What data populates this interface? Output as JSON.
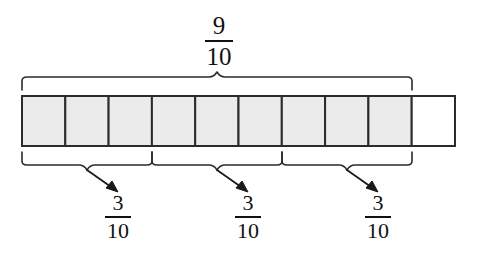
{
  "figure": {
    "kind": "fraction-bar-model",
    "background_color": "#ffffff",
    "ink_color": "#111111",
    "shaded_fill_color": "#ebebeb",
    "unshaded_fill_color": "#ffffff"
  },
  "bar": {
    "total_parts": 10,
    "shaded_parts": 9,
    "unshaded_parts": 1,
    "cells": [
      {
        "index": 1,
        "shaded": true
      },
      {
        "index": 2,
        "shaded": true
      },
      {
        "index": 3,
        "shaded": true
      },
      {
        "index": 4,
        "shaded": true
      },
      {
        "index": 5,
        "shaded": true
      },
      {
        "index": 6,
        "shaded": true
      },
      {
        "index": 7,
        "shaded": true
      },
      {
        "index": 8,
        "shaded": true
      },
      {
        "index": 9,
        "shaded": true
      },
      {
        "index": 10,
        "shaded": false
      }
    ],
    "geometry": {
      "x": 22,
      "y": 96,
      "width": 433,
      "height": 50,
      "cell_width": 43.3
    }
  },
  "top_brace": {
    "label": {
      "numerator": "9",
      "denominator": "10"
    },
    "covers_parts": 9,
    "span_start_x": 22,
    "span_end_x": 412,
    "y": 88,
    "peak_x": 217
  },
  "bottom_braces": [
    {
      "label": {
        "numerator": "3",
        "denominator": "10"
      },
      "covers_parts": 3,
      "span_start_x": 22,
      "span_end_x": 152,
      "y": 153,
      "notch_x": 87,
      "arrow_tip_x": 118,
      "arrow_tip_y": 192
    },
    {
      "label": {
        "numerator": "3",
        "denominator": "10"
      },
      "covers_parts": 3,
      "span_start_x": 152,
      "span_end_x": 282,
      "y": 153,
      "notch_x": 217,
      "arrow_tip_x": 248,
      "arrow_tip_y": 192
    },
    {
      "label": {
        "numerator": "3",
        "denominator": "10"
      },
      "covers_parts": 3,
      "span_start_x": 282,
      "span_end_x": 412,
      "y": 153,
      "notch_x": 347,
      "arrow_tip_x": 378,
      "arrow_tip_y": 192
    }
  ]
}
